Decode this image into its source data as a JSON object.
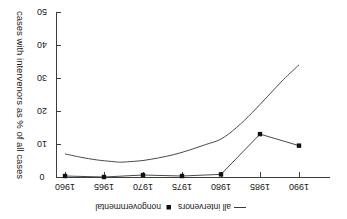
{
  "chart_data": {
    "type": "line",
    "title": "",
    "subtitle": "",
    "xlabel": "",
    "ylabel": "cases with intervenors as % of all cases",
    "x_ticks": [
      "1960",
      "1965",
      "1970",
      "1975",
      "1980",
      "1985",
      "1990"
    ],
    "x_tick_values": [
      1960,
      1965,
      1970,
      1975,
      1980,
      1985,
      1990
    ],
    "y_ticks": [
      "0",
      "10",
      "20",
      "30",
      "40",
      "50"
    ],
    "y_tick_values": [
      0,
      10,
      20,
      30,
      40,
      50
    ],
    "xlim": [
      1957.5,
      1992.5
    ],
    "ylim": [
      0,
      50
    ],
    "grid": false,
    "legend_position": "top",
    "orientation": "rotated-180",
    "series": [
      {
        "name": "all intervenors",
        "legend_label": "all intervenors",
        "legend_marker": "line",
        "style": "smooth-line",
        "marker": "none",
        "color": "#4a4a4a",
        "x": [
          1960,
          1962,
          1964,
          1966,
          1967,
          1968,
          1970,
          1972,
          1974,
          1976,
          1978,
          1980,
          1982,
          1984,
          1986,
          1988,
          1990
        ],
        "values": [
          7.0,
          6.0,
          5.2,
          4.7,
          4.5,
          4.6,
          5.0,
          5.8,
          6.8,
          8.2,
          9.8,
          11.5,
          15.0,
          19.5,
          24.5,
          29.5,
          34.0
        ]
      },
      {
        "name": "nongovernmental",
        "legend_label": "nongovernmental",
        "legend_marker": "square-point",
        "style": "line-with-markers",
        "marker": "square",
        "color": "#4a4a4a",
        "x": [
          1960,
          1965,
          1970,
          1975,
          1980,
          1985,
          1990
        ],
        "values": [
          0.3,
          0.0,
          0.6,
          0.3,
          0.8,
          13.0,
          9.5
        ]
      }
    ]
  },
  "legend": {
    "entries": [
      {
        "label": "all intervenors",
        "glyph": "line-glyph"
      },
      {
        "label": "nongovernmental",
        "glyph": "square-glyph"
      }
    ]
  },
  "axes": {
    "y_axis_title": "cases with intervenors as % of all cases"
  }
}
